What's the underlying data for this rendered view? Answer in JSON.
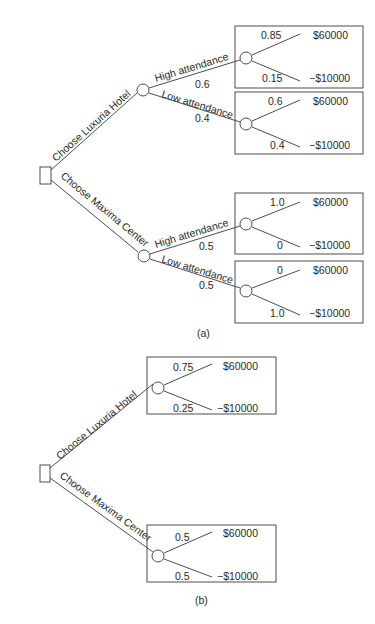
{
  "diagram_a": {
    "caption": "(a)",
    "decision_node": "decision-square",
    "options": [
      {
        "label": "Choose Luxuria Hotel",
        "branches": [
          {
            "label": "High attendance",
            "prob": "0.6",
            "outcomes": [
              {
                "prob": "0.85",
                "value": "$60000"
              },
              {
                "prob": "0.15",
                "value": "−$10000"
              }
            ]
          },
          {
            "label": "Low attendance",
            "prob": "0.4",
            "outcomes": [
              {
                "prob": "0.6",
                "value": "$60000"
              },
              {
                "prob": "0.4",
                "value": "−$10000"
              }
            ]
          }
        ]
      },
      {
        "label": "Choose Maxima Center",
        "branches": [
          {
            "label": "High attendance",
            "prob": "0.5",
            "outcomes": [
              {
                "prob": "1.0",
                "value": "$60000"
              },
              {
                "prob": "0",
                "value": "−$10000"
              }
            ]
          },
          {
            "label": "Low attendance",
            "prob": "0.5",
            "outcomes": [
              {
                "prob": "0",
                "value": "$60000"
              },
              {
                "prob": "1.0",
                "value": "−$10000"
              }
            ]
          }
        ]
      }
    ]
  },
  "diagram_b": {
    "caption": "(b)",
    "options": [
      {
        "label": "Choose Luxuria Hotel",
        "outcomes": [
          {
            "prob": "0.75",
            "value": "$60000"
          },
          {
            "prob": "0.25",
            "value": "−$10000"
          }
        ]
      },
      {
        "label": "Choose Maxima Center",
        "outcomes": [
          {
            "prob": "0.5",
            "value": "$60000"
          },
          {
            "prob": "0.5",
            "value": "−$10000"
          }
        ]
      }
    ]
  }
}
